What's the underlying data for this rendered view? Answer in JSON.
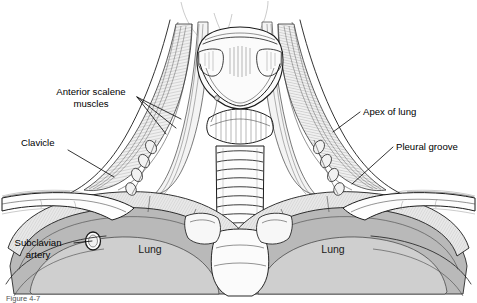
{
  "figure": {
    "caption": "Figure 4-7",
    "background_color": "#ffffff",
    "ink_color": "#1b1b1b"
  },
  "labels": [
    {
      "id": "anterior-scalene-muscles",
      "lines": [
        "Anterior scalene",
        "muscles"
      ],
      "align": "middle",
      "x": 91,
      "y": 95,
      "line_height": 11.5,
      "leaders": [
        {
          "x1": 137,
          "y1": 97,
          "x2": 181,
          "y2": 119
        },
        {
          "x1": 137,
          "y1": 97,
          "x2": 176,
          "y2": 128
        },
        {
          "x1": 137,
          "y1": 97,
          "x2": 166,
          "y2": 134
        }
      ]
    },
    {
      "id": "clavicle",
      "lines": [
        "Clavicle"
      ],
      "align": "start",
      "x": 21,
      "y": 146,
      "line_height": 11.5,
      "leaders": [
        {
          "x1": 68,
          "y1": 150,
          "x2": 114,
          "y2": 177
        }
      ]
    },
    {
      "id": "subclavian-artery",
      "lines": [
        "Subclavian",
        "artery"
      ],
      "align": "middle",
      "x": 38,
      "y": 246,
      "line_height": 11.5,
      "leaders": [
        {
          "x1": 74,
          "y1": 243,
          "x2": 92,
          "y2": 241
        }
      ]
    },
    {
      "id": "apex-of-lung",
      "lines": [
        "Apex of lung"
      ],
      "align": "start",
      "x": 363,
      "y": 115,
      "line_height": 11.5,
      "leaders": [
        {
          "x1": 360,
          "y1": 112,
          "x2": 333,
          "y2": 132
        }
      ]
    },
    {
      "id": "pleural-groove",
      "lines": [
        "Pleural groove"
      ],
      "align": "start",
      "x": 396,
      "y": 150,
      "line_height": 11.5,
      "leaders": [
        {
          "x1": 393,
          "y1": 147,
          "x2": 352,
          "y2": 184
        }
      ]
    },
    {
      "id": "lung-left",
      "lines": [
        "Lung"
      ],
      "align": "middle",
      "x": 150,
      "y": 253,
      "line_height": 11.5,
      "leaders": []
    },
    {
      "id": "lung-right",
      "lines": [
        "Lung"
      ],
      "align": "middle",
      "x": 333,
      "y": 253,
      "line_height": 11.5,
      "leaders": []
    }
  ],
  "colors": {
    "lung_fill": "#b9b9b9",
    "lung_fill_dark": "#a6a6a6",
    "lung_fill_light": "#cccccc",
    "muscle_fill": "#ededed",
    "cartilage_fill": "#f4f4f4",
    "skin_fill": "#ffffff",
    "ink": "#1b1b1b",
    "label_text": "#000000",
    "caption_text": "#555555"
  },
  "regions": [
    {
      "name": "larynx-thyroid-cartilage",
      "description": "central laryngeal cartilage block at top of neck"
    },
    {
      "name": "trachea",
      "description": "vertical stack of tracheal rings below larynx"
    },
    {
      "name": "anterior-scalene-muscle-left",
      "description": "striated muscle band descending to first rib, left side"
    },
    {
      "name": "anterior-scalene-muscle-right",
      "description": "striated muscle band descending to first rib, right side"
    },
    {
      "name": "clavicle-left",
      "description": "horizontal bone crossing lower left"
    },
    {
      "name": "clavicle-right",
      "description": "horizontal bone crossing lower right"
    },
    {
      "name": "first-rib-left",
      "description": "curved rib arc enclosing left lung apex"
    },
    {
      "name": "first-rib-right",
      "description": "curved rib arc enclosing right lung apex"
    },
    {
      "name": "lung-apex-left",
      "description": "gray shaded lung field, left"
    },
    {
      "name": "lung-apex-right",
      "description": "gray shaded lung field, right"
    },
    {
      "name": "subclavian-artery-ring",
      "description": "small ring marking vessel cross-section"
    },
    {
      "name": "mandible-outline",
      "description": "faint chin and jaw contour at top"
    },
    {
      "name": "shoulder-outline-left",
      "description": "faint deltoid and arm contour, left"
    },
    {
      "name": "shoulder-outline-right",
      "description": "faint deltoid and arm contour, right"
    }
  ]
}
